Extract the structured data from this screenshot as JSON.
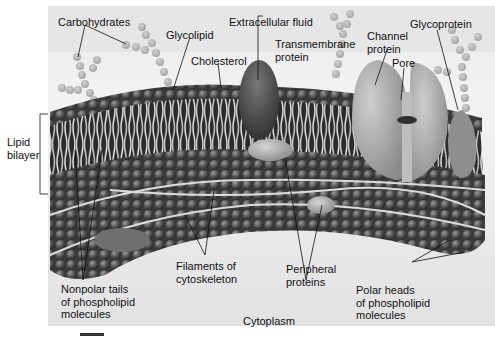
{
  "figure": {
    "regions": {
      "top": "Extracellular fluid",
      "bottom": "Cytoplasm"
    },
    "labels": {
      "carbohydrates": "Carbohydrates",
      "glycolipid": "Glycolipid",
      "extracellular_fluid": "Extracellular fluid",
      "cholesterol": "Cholesterol",
      "transmembrane_protein_1": "Transmembrane",
      "transmembrane_protein_2": "protein",
      "channel_protein_1": "Channel",
      "channel_protein_2": "protein",
      "pore": "Pore",
      "glycoprotein": "Glycoprotein",
      "lipid_bilayer_1": "Lipid",
      "lipid_bilayer_2": "bilayer",
      "nonpolar_tails_1": "Nonpolar tails",
      "nonpolar_tails_2": "of phospholipid",
      "nonpolar_tails_3": "molecules",
      "filaments_1": "Filaments of",
      "filaments_2": "cytoskeleton",
      "peripheral_1": "Peripheral",
      "peripheral_2": "proteins",
      "polar_heads_1": "Polar heads",
      "polar_heads_2": "of phospholipid",
      "polar_heads_3": "molecules",
      "cytoplasm": "Cytoplasm"
    },
    "colors": {
      "background": "#ececec",
      "lipid_head": "#5a5a5a",
      "lipid_tail": "#cfcfcf",
      "sugar": "#b8b8b8",
      "protein_dark": "#4a4a4a",
      "protein_light": "#a9a9a9",
      "filament": "#d8d8d8",
      "leader_line": "#111111"
    }
  }
}
